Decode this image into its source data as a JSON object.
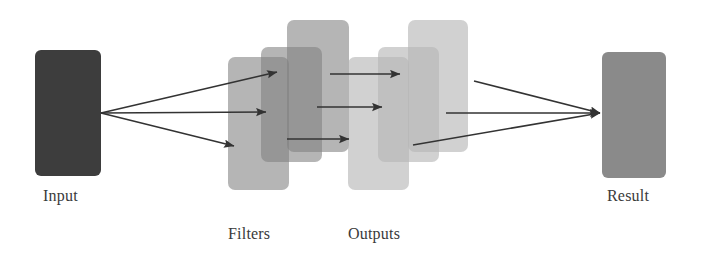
{
  "diagram": {
    "background_color": "#ffffff",
    "width": 702,
    "height": 253,
    "arrow_color": "#333333",
    "label_color": "#3a3a3a"
  },
  "nodes": {
    "input": {
      "label": "Input",
      "color": "#3d3d3d",
      "x": 35,
      "y": 50,
      "width": 66,
      "height": 126,
      "radius": 6,
      "label_x": 43,
      "label_y": 188
    },
    "result": {
      "label": "Result",
      "color": "#8a8a8a",
      "x": 602,
      "y": 52,
      "width": 64,
      "height": 126,
      "radius": 6,
      "label_x": 607,
      "label_y": 188
    }
  },
  "groups": [
    {
      "name": "filters",
      "label": "Filters",
      "label_x": 228,
      "label_y": 226,
      "color": "#808080",
      "opacity": 0.58,
      "radius": 7,
      "cards": [
        {
          "x": 228,
          "y": 57,
          "width": 61,
          "height": 133
        },
        {
          "x": 261,
          "y": 47,
          "width": 61,
          "height": 115
        },
        {
          "x": 287,
          "y": 20,
          "width": 62,
          "height": 132
        }
      ]
    },
    {
      "name": "outputs",
      "label": "Outputs",
      "label_x": 348,
      "label_y": 226,
      "color": "#b4b4b4",
      "opacity": 0.62,
      "radius": 7,
      "cards": [
        {
          "x": 348,
          "y": 57,
          "width": 61,
          "height": 133
        },
        {
          "x": 378,
          "y": 47,
          "width": 61,
          "height": 115
        },
        {
          "x": 408,
          "y": 20,
          "width": 60,
          "height": 132
        }
      ]
    }
  ],
  "arrows": {
    "stroke_width": 1.6,
    "head_size": 6,
    "input_fan": {
      "origin": {
        "x": 101,
        "y": 113
      },
      "targets": [
        {
          "x": 277,
          "y": 72
        },
        {
          "x": 266,
          "y": 112
        },
        {
          "x": 234,
          "y": 146
        }
      ]
    },
    "middle": [
      {
        "x1": 330,
        "y1": 74,
        "x2": 400,
        "y2": 74
      },
      {
        "x1": 317,
        "y1": 107,
        "x2": 382,
        "y2": 107
      },
      {
        "x1": 287,
        "y1": 139,
        "x2": 349,
        "y2": 139
      }
    ],
    "result_fan": {
      "target": {
        "x": 600,
        "y": 113
      },
      "origins": [
        {
          "x": 474,
          "y": 81
        },
        {
          "x": 446,
          "y": 113
        },
        {
          "x": 413,
          "y": 145
        }
      ]
    }
  }
}
